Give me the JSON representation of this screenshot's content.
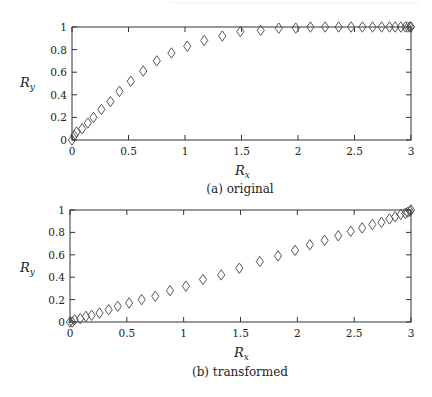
{
  "chart_data": [
    {
      "type": "scatter",
      "title": "",
      "caption": "(a) original",
      "xlabel": "R_x",
      "ylabel": "R_y",
      "xlim": [
        0,
        3
      ],
      "ylim": [
        0,
        1
      ],
      "xticks": [
        "0",
        "0.5",
        "1",
        "1.5",
        "2",
        "2.5",
        "3"
      ],
      "yticks": [
        "0",
        "0.2",
        "0.4",
        "0.6",
        "0.8",
        "1"
      ],
      "grid": false,
      "marker": "diamond-open",
      "series": [
        {
          "name": "original",
          "x": [
            0.0,
            0.02,
            0.04,
            0.09,
            0.14,
            0.19,
            0.26,
            0.34,
            0.42,
            0.52,
            0.63,
            0.75,
            0.88,
            1.02,
            1.17,
            1.33,
            1.49,
            1.67,
            1.83,
            1.98,
            2.11,
            2.24,
            2.36,
            2.47,
            2.57,
            2.66,
            2.74,
            2.81,
            2.86,
            2.91,
            2.95,
            2.97,
            2.99,
            3.0
          ],
          "y": [
            0.0,
            0.04,
            0.07,
            0.1,
            0.15,
            0.2,
            0.27,
            0.34,
            0.43,
            0.52,
            0.61,
            0.7,
            0.77,
            0.83,
            0.88,
            0.92,
            0.96,
            0.97,
            0.99,
            0.99,
            1.0,
            1.0,
            1.0,
            1.0,
            1.0,
            1.0,
            1.0,
            1.0,
            1.0,
            1.0,
            1.0,
            1.0,
            1.0,
            1.0
          ]
        }
      ]
    },
    {
      "type": "scatter",
      "title": "",
      "caption": "(b) transformed",
      "xlabel": "R_x",
      "ylabel": "R_y",
      "xlim": [
        0,
        3
      ],
      "ylim": [
        0,
        1
      ],
      "xticks": [
        "0",
        "0.5",
        "1",
        "1.5",
        "2",
        "2.5",
        "3"
      ],
      "yticks": [
        "0",
        "0.2",
        "0.4",
        "0.6",
        "0.8",
        "1"
      ],
      "grid": false,
      "marker": "diamond-open",
      "series": [
        {
          "name": "transformed",
          "x": [
            0.0,
            0.02,
            0.04,
            0.09,
            0.14,
            0.19,
            0.26,
            0.34,
            0.42,
            0.52,
            0.63,
            0.75,
            0.88,
            1.02,
            1.17,
            1.33,
            1.49,
            1.67,
            1.83,
            1.98,
            2.11,
            2.24,
            2.36,
            2.47,
            2.57,
            2.66,
            2.74,
            2.81,
            2.86,
            2.91,
            2.95,
            2.97,
            2.99,
            3.0
          ],
          "y": [
            0.0,
            0.0,
            0.02,
            0.03,
            0.05,
            0.06,
            0.08,
            0.11,
            0.14,
            0.17,
            0.2,
            0.23,
            0.28,
            0.32,
            0.38,
            0.42,
            0.48,
            0.54,
            0.59,
            0.64,
            0.69,
            0.73,
            0.77,
            0.81,
            0.84,
            0.87,
            0.89,
            0.92,
            0.94,
            0.96,
            0.97,
            0.98,
            0.99,
            1.0
          ]
        }
      ]
    }
  ],
  "labels": {
    "x_main": "R",
    "x_sub": "x",
    "y_main": "R",
    "y_sub": "y"
  }
}
